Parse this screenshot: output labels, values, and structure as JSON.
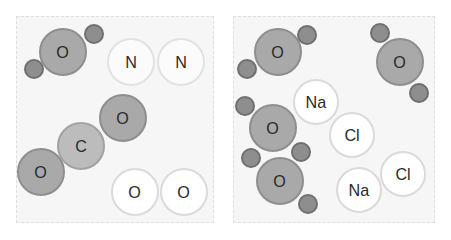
{
  "panels": [
    {
      "name": "left",
      "box": {
        "x": 16,
        "y": 16,
        "w": 198,
        "h": 207
      },
      "atoms": [
        {
          "label": "",
          "type": "h",
          "x": 34,
          "y": 69,
          "r": 10
        },
        {
          "label": "",
          "type": "h",
          "x": 94,
          "y": 34,
          "r": 10
        },
        {
          "label": "O",
          "type": "o-dark",
          "x": 63,
          "y": 52,
          "r": 24
        },
        {
          "label": "N",
          "type": "white light",
          "x": 131,
          "y": 62,
          "r": 24
        },
        {
          "label": "N",
          "type": "white light",
          "x": 181,
          "y": 62,
          "r": 24
        },
        {
          "label": "O",
          "type": "o-dark",
          "x": 123,
          "y": 118,
          "r": 24
        },
        {
          "label": "C",
          "type": "c",
          "x": 81,
          "y": 146,
          "r": 24
        },
        {
          "label": "O",
          "type": "o-dark",
          "x": 41,
          "y": 172,
          "r": 24
        },
        {
          "label": "O",
          "type": "white",
          "x": 135,
          "y": 192,
          "r": 24
        },
        {
          "label": "O",
          "type": "white",
          "x": 184,
          "y": 192,
          "r": 24
        }
      ]
    },
    {
      "name": "right",
      "box": {
        "x": 233,
        "y": 16,
        "w": 202,
        "h": 207
      },
      "atoms": [
        {
          "label": "",
          "type": "h",
          "x": 247,
          "y": 69,
          "r": 10
        },
        {
          "label": "",
          "type": "h",
          "x": 307,
          "y": 35,
          "r": 10
        },
        {
          "label": "O",
          "type": "o-dark",
          "x": 278,
          "y": 52,
          "r": 24
        },
        {
          "label": "",
          "type": "h",
          "x": 380,
          "y": 33,
          "r": 10
        },
        {
          "label": "",
          "type": "h",
          "x": 419,
          "y": 93,
          "r": 10
        },
        {
          "label": "O",
          "type": "o-dark",
          "x": 400,
          "y": 62,
          "r": 24
        },
        {
          "label": "Na",
          "type": "white",
          "x": 316,
          "y": 102,
          "r": 23
        },
        {
          "label": "Cl",
          "type": "white",
          "x": 352,
          "y": 135,
          "r": 23
        },
        {
          "label": "",
          "type": "h",
          "x": 245,
          "y": 106,
          "r": 10
        },
        {
          "label": "",
          "type": "h",
          "x": 301,
          "y": 152,
          "r": 10
        },
        {
          "label": "O",
          "type": "o-dark",
          "x": 273,
          "y": 128,
          "r": 24
        },
        {
          "label": "",
          "type": "h",
          "x": 251,
          "y": 158,
          "r": 10
        },
        {
          "label": "",
          "type": "h",
          "x": 308,
          "y": 204,
          "r": 10
        },
        {
          "label": "O",
          "type": "o-dark",
          "x": 280,
          "y": 181,
          "r": 24
        },
        {
          "label": "Cl",
          "type": "white",
          "x": 403,
          "y": 174,
          "r": 23
        },
        {
          "label": "Na",
          "type": "white",
          "x": 359,
          "y": 190,
          "r": 23
        }
      ]
    }
  ],
  "colors": {
    "oxygen_fill": "#a9a9a9",
    "carbon_fill": "#bcbcbc",
    "hydrogen_fill": "#8e8e8e",
    "white_atom_fill": "#ffffff",
    "panel_bg": "#f6f6f6"
  }
}
